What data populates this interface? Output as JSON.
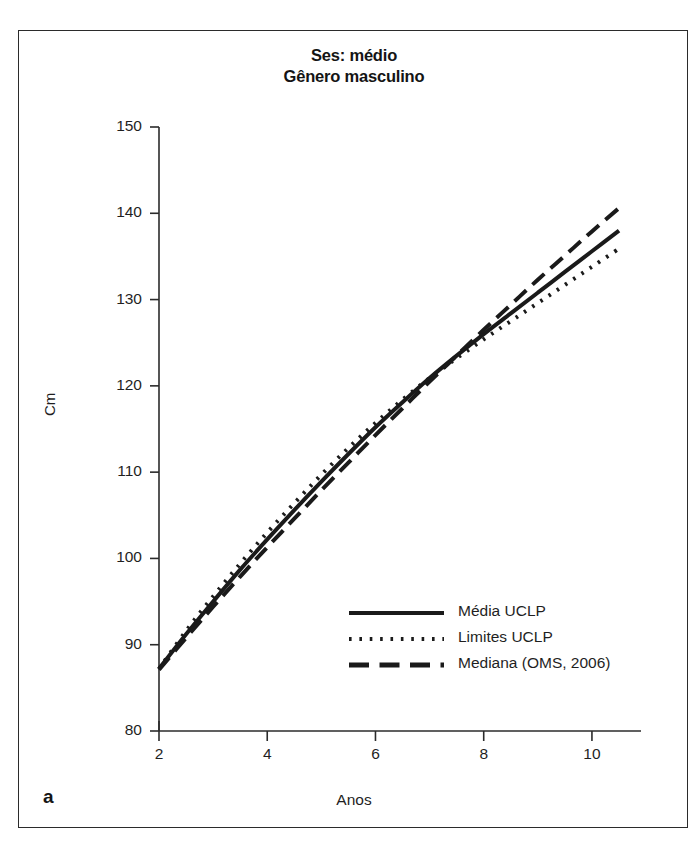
{
  "figure": {
    "panel_label": "a"
  },
  "chart_data": {
    "type": "line",
    "title": "Ses: médio\nGênero masculino",
    "title_line1": "Ses: médio",
    "title_line2": "Gênero masculino",
    "xlabel": "Anos",
    "ylabel": "Cm",
    "xlim": [
      2,
      10.5
    ],
    "ylim": [
      80,
      150
    ],
    "xticks": [
      2,
      4,
      6,
      8,
      10
    ],
    "yticks": [
      80,
      90,
      100,
      110,
      120,
      130,
      140,
      150
    ],
    "xtick_labels": [
      "2",
      "4",
      "6",
      "8",
      "10"
    ],
    "ytick_labels": [
      "80",
      "90",
      "100",
      "110",
      "120",
      "130",
      "140",
      "150"
    ],
    "grid": false,
    "legend_position": "lower-right",
    "x": [
      2,
      2.5,
      3,
      3.5,
      4,
      4.5,
      5,
      5.5,
      6,
      6.5,
      7,
      7.5,
      8,
      8.5,
      9,
      9.5,
      10,
      10.5
    ],
    "series": [
      {
        "name": "Média UCLP",
        "style": "solid",
        "color": "#1a1a1a",
        "values": [
          87.2,
          91.2,
          95.0,
          98.7,
          102.2,
          105.6,
          108.9,
          112.1,
          115.2,
          118.1,
          120.9,
          123.5,
          126.0,
          128.4,
          130.8,
          133.2,
          135.6,
          138.0
        ]
      },
      {
        "name": "Limites UCLP",
        "style": "dotted",
        "color": "#1a1a1a",
        "values": [
          87.2,
          91.6,
          95.6,
          99.4,
          103.0,
          106.4,
          109.7,
          112.8,
          115.7,
          118.4,
          120.9,
          123.2,
          125.4,
          127.5,
          129.6,
          131.7,
          133.8,
          135.9
        ]
      },
      {
        "name": "Mediana (OMS, 2006)",
        "style": "dashed",
        "color": "#1a1a1a",
        "values": [
          87.1,
          90.8,
          94.4,
          97.9,
          101.3,
          104.6,
          107.9,
          111.1,
          114.3,
          117.4,
          120.5,
          123.5,
          126.5,
          129.4,
          132.3,
          135.1,
          137.9,
          140.6
        ]
      }
    ],
    "legend": [
      {
        "label": "Média UCLP",
        "style": "solid"
      },
      {
        "label": "Limites UCLP",
        "style": "dotted"
      },
      {
        "label": "Mediana (OMS, 2006)",
        "style": "dashed"
      }
    ]
  }
}
